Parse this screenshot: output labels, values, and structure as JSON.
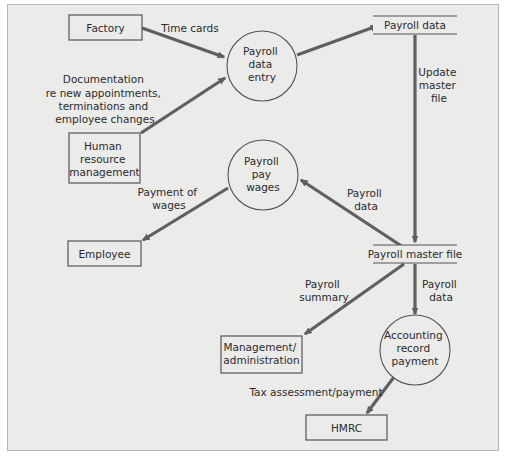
{
  "diagram": {
    "type": "data-flow-diagram",
    "external_entities": {
      "factory": [
        "Factory"
      ],
      "hr": [
        "Human",
        "resource",
        "management"
      ],
      "employee": [
        "Employee"
      ],
      "management": [
        "Management/",
        "administration"
      ],
      "hmrc": [
        "HMRC"
      ]
    },
    "processes": {
      "payroll_entry": [
        "Payroll",
        "data",
        "entry"
      ],
      "pay_wages": [
        "Payroll",
        "pay",
        "wages"
      ],
      "accounting": [
        "Accounting",
        "record",
        "payment"
      ]
    },
    "data_stores": {
      "payroll_data": "Payroll data",
      "master_file": "Payroll master file"
    },
    "flows": {
      "time_cards": [
        "Time cards"
      ],
      "documentation": [
        "Documentation",
        "re new appointments,",
        "terminations and",
        "employee changes"
      ],
      "update_master": [
        "Update",
        "master",
        "file"
      ],
      "payroll_data_to_wages": [
        "Payroll",
        "data"
      ],
      "payment_of_wages": [
        "Payment of",
        "wages"
      ],
      "payroll_summary": [
        "Payroll",
        "summary"
      ],
      "payroll_data_to_accounting": [
        "Payroll",
        "data"
      ],
      "tax": [
        "Tax assessment/payment"
      ]
    }
  }
}
